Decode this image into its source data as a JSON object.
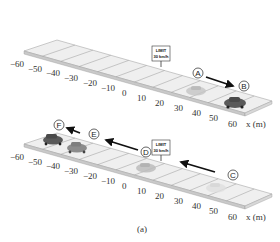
{
  "figure": {
    "caption": "(a)",
    "axis_label": "x (m)",
    "ticks": [
      "−60",
      "−50",
      "−40",
      "−30",
      "−20",
      "−10",
      "0",
      "10",
      "20",
      "30",
      "40",
      "50",
      "60"
    ],
    "sign": {
      "line1": "LIMIT",
      "line2": "30 km/h"
    }
  },
  "panels": [
    {
      "name": "top-road",
      "points": [
        {
          "label": "A",
          "x_m": 30,
          "car_shade": "light"
        },
        {
          "label": "B",
          "x_m": 52,
          "car_shade": "dark"
        }
      ],
      "arrow": {
        "from": "A",
        "to": "B",
        "direction": "+x"
      }
    },
    {
      "name": "bottom-road",
      "points": [
        {
          "label": "C",
          "x_m": 38,
          "car_shade": "faint"
        },
        {
          "label": "D",
          "x_m": 0,
          "car_shade": "light"
        },
        {
          "label": "E",
          "x_m": -37,
          "car_shade": "medium"
        },
        {
          "label": "F",
          "x_m": -53,
          "car_shade": "dark"
        }
      ],
      "arrows": [
        {
          "from": "C",
          "to": "D",
          "direction": "-x"
        },
        {
          "from": "D",
          "to": "E",
          "direction": "-x"
        },
        {
          "from": "E",
          "to": "F",
          "direction": "-x"
        }
      ]
    }
  ],
  "colors": {
    "road_top": "#eeeeee",
    "road_edge": "#c8c8c8",
    "road_line": "#9a9a9a",
    "arrow": "#111111",
    "car_dark": "#555555",
    "car_medium": "#8a8a8a",
    "car_light": "#b8b8b8",
    "car_faint": "#dcdcdc"
  }
}
